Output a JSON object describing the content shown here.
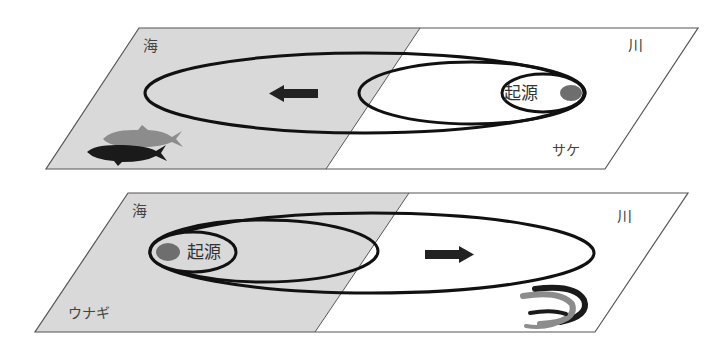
{
  "colors": {
    "sea": "#d9d9d9",
    "river": "#ffffff",
    "outline": "#555555",
    "ellipse": "#111111",
    "origin_dot": "#6e6e6e",
    "arrow": "#222222",
    "fish_gray": "#8c8c8c",
    "fish_black": "#1a1a1a"
  },
  "panels": [
    {
      "id": "salmon",
      "sea_label": "海",
      "river_label": "川",
      "origin_label": "起源",
      "species_label": "サケ",
      "origin_side": "river",
      "arrow_direction": "left"
    },
    {
      "id": "eel",
      "sea_label": "海",
      "river_label": "川",
      "origin_label": "起源",
      "species_label": "ウナギ",
      "origin_side": "sea",
      "arrow_direction": "right"
    }
  ]
}
